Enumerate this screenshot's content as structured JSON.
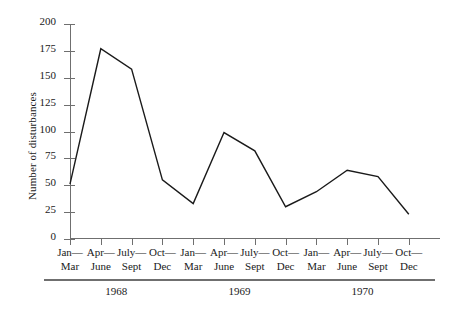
{
  "chart_data": {
    "type": "line",
    "title": "",
    "xlabel": "",
    "ylabel": "Number of disturbances",
    "ylim": [
      0,
      200
    ],
    "yticks": [
      0,
      25,
      50,
      75,
      100,
      125,
      150,
      175,
      200
    ],
    "ytick_labels": [
      "0",
      "25",
      "50",
      "75",
      "100",
      "125",
      "150",
      "175",
      "200"
    ],
    "grid": false,
    "legend": "none",
    "categories": [
      "Jan—Mar",
      "Apr—June",
      "July—Sept",
      "Oct—Dec",
      "Jan—Mar",
      "Apr—June",
      "July—Sept",
      "Oct—Dec",
      "Jan—Mar",
      "Apr—June",
      "July—Sept",
      "Oct—Dec"
    ],
    "category_lines": [
      [
        "Jan—",
        "Mar"
      ],
      [
        "Apr—",
        "June"
      ],
      [
        "July—",
        "Sept"
      ],
      [
        "Oct—",
        "Dec"
      ],
      [
        "Jan—",
        "Mar"
      ],
      [
        "Apr—",
        "June"
      ],
      [
        "July—",
        "Sept"
      ],
      [
        "Oct—",
        "Dec"
      ],
      [
        "Jan—",
        "Mar"
      ],
      [
        "Apr—",
        "June"
      ],
      [
        "July—",
        "Sept"
      ],
      [
        "Oct—",
        "Dec"
      ]
    ],
    "values": [
      51,
      177,
      158,
      55,
      33,
      99,
      82,
      30,
      44,
      64,
      58,
      23
    ],
    "groups": [
      {
        "label": "1968",
        "start_index": 0,
        "end_index": 3
      },
      {
        "label": "1969",
        "start_index": 4,
        "end_index": 7
      },
      {
        "label": "1970",
        "start_index": 8,
        "end_index": 11
      }
    ],
    "line_color": "#1a1a1a",
    "axis_color": "#6f6f6f",
    "background_color": "#ffffff"
  }
}
